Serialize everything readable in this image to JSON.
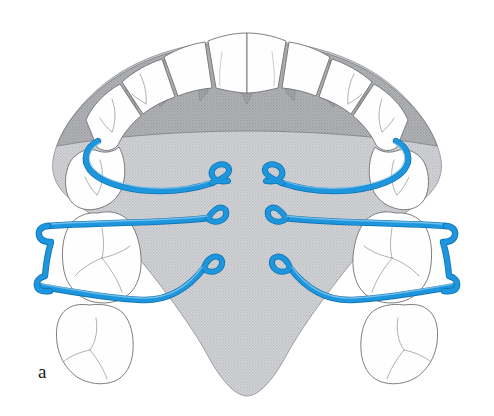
{
  "figure": {
    "panel_label": "a",
    "view": "occlusal view of upper arch"
  },
  "colors": {
    "wire_blue": "#1e96dd",
    "wire_blue_dark": "#1277b8",
    "wire_highlight": "#7fc6ee",
    "palate_light_gray": "#c9cbce",
    "palate_dark_gray": "#a6a8ab",
    "tooth_fill": "#fefefe",
    "outline_gray": "#6e7073",
    "fissure_gray": "#9a9ca0",
    "label_black": "#1a1a1a",
    "background": "#ffffff"
  },
  "anatomy": {
    "palate": {
      "name": "hard palate",
      "shading": "stippled light gray"
    },
    "rugae_band": {
      "name": "anterior palatal gingival band",
      "shading": "stippled medium gray"
    },
    "teeth": [
      {
        "id": "UR1",
        "name": "upper-right-central-incisor",
        "arch_position": "anterior"
      },
      {
        "id": "UL1",
        "name": "upper-left-central-incisor",
        "arch_position": "anterior"
      },
      {
        "id": "UR2",
        "name": "upper-right-lateral-incisor",
        "arch_position": "anterior"
      },
      {
        "id": "UL2",
        "name": "upper-left-lateral-incisor",
        "arch_position": "anterior"
      },
      {
        "id": "UR3",
        "name": "upper-right-canine",
        "arch_position": "anterior"
      },
      {
        "id": "UL3",
        "name": "upper-left-canine",
        "arch_position": "anterior"
      },
      {
        "id": "UR4",
        "name": "upper-right-first-premolar",
        "arch_position": "posterior"
      },
      {
        "id": "UL4",
        "name": "upper-left-first-premolar",
        "arch_position": "posterior"
      },
      {
        "id": "UR5",
        "name": "upper-right-second-premolar",
        "arch_position": "posterior"
      },
      {
        "id": "UL5",
        "name": "upper-left-second-premolar",
        "arch_position": "posterior"
      },
      {
        "id": "UR6",
        "name": "upper-right-first-molar",
        "arch_position": "posterior"
      },
      {
        "id": "UL6",
        "name": "upper-left-first-molar",
        "arch_position": "posterior"
      },
      {
        "id": "UR7",
        "name": "upper-right-second-molar",
        "arch_position": "posterior"
      },
      {
        "id": "UL7",
        "name": "upper-left-second-molar",
        "arch_position": "posterior"
      }
    ]
  },
  "appliance": {
    "name": "palatal finger springs with molar clasps",
    "wire_count": 6,
    "helix_loop_count": 6,
    "clasp_count": 2,
    "springs": [
      {
        "id": "spring-left-1",
        "side": "left",
        "level": "upper",
        "loop": "helix-loop"
      },
      {
        "id": "spring-right-1",
        "side": "right",
        "level": "upper",
        "loop": "helix-loop"
      },
      {
        "id": "spring-left-2",
        "side": "left",
        "level": "middle",
        "loop": "helix-loop"
      },
      {
        "id": "spring-right-2",
        "side": "right",
        "level": "middle",
        "loop": "helix-loop"
      },
      {
        "id": "spring-left-3",
        "side": "left",
        "level": "lower",
        "loop": "helix-loop"
      },
      {
        "id": "spring-right-3",
        "side": "right",
        "level": "lower",
        "loop": "helix-loop"
      }
    ],
    "clasps": [
      {
        "id": "clasp-left",
        "side": "left",
        "tooth": "UL6",
        "shape": "adams-bracket"
      },
      {
        "id": "clasp-right",
        "side": "right",
        "tooth": "UR6",
        "shape": "adams-bracket"
      }
    ]
  }
}
